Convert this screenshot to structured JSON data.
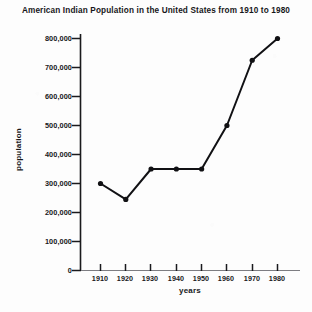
{
  "chart_data": {
    "type": "line",
    "title": "American Indian Population in the United States from 1910 to 1980",
    "xlabel": "years",
    "ylabel": "population",
    "categories": [
      1910,
      1920,
      1930,
      1940,
      1950,
      1960,
      1970,
      1980
    ],
    "values": [
      300000,
      245000,
      350000,
      350000,
      350000,
      500000,
      725000,
      800000
    ],
    "x_tick_labels": [
      "1910",
      "1920",
      "1930",
      "1940",
      "1950",
      "1960",
      "1970",
      "1980"
    ],
    "y_tick_labels": [
      "800,000",
      "700,000",
      "600,000",
      "500,000",
      "400,000",
      "300,000",
      "200,000",
      "100,000",
      "0"
    ],
    "y_tick_values": [
      800000,
      700000,
      600000,
      500000,
      400000,
      300000,
      200000,
      100000,
      0
    ],
    "xlim": [
      1905,
      1985
    ],
    "ylim": [
      0,
      800000
    ],
    "grid": false,
    "legend": false,
    "line_color": "#111114",
    "marker": "circle",
    "marker_color": "#111114",
    "background_color": "#fdfdfd"
  }
}
